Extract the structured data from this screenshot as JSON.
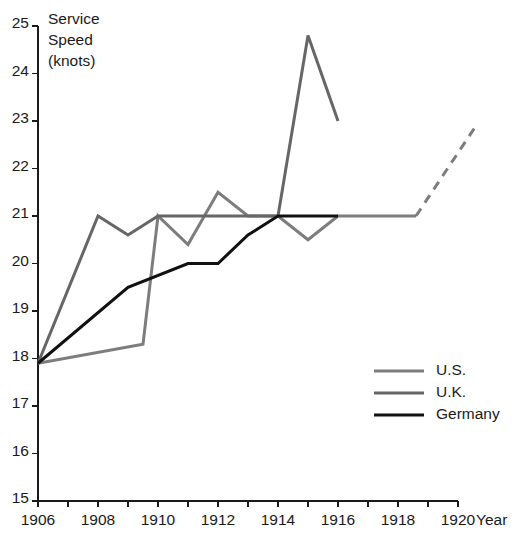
{
  "chart_data": {
    "type": "line",
    "title": "",
    "xlabel": "Year",
    "ylabel": "Service Speed (knots)",
    "ylabel_lines": [
      "Service",
      "Speed",
      "(knots)"
    ],
    "xlim": [
      1906,
      1920
    ],
    "ylim": [
      15,
      25
    ],
    "grid": false,
    "legend_position": "center-right",
    "x_ticks": [
      1906,
      1907,
      1908,
      1909,
      1910,
      1911,
      1912,
      1913,
      1914,
      1915,
      1916,
      1917,
      1918,
      1919,
      1920
    ],
    "x_tick_labels": [
      "1906",
      "",
      "1908",
      "",
      "1910",
      "",
      "1912",
      "",
      "1914",
      "",
      "1916",
      "",
      "1918",
      "",
      "1920"
    ],
    "y_ticks": [
      15,
      16,
      17,
      18,
      19,
      20,
      21,
      22,
      23,
      24,
      25
    ],
    "y_tick_labels": [
      "15",
      "16",
      "17",
      "18",
      "19",
      "20",
      "21",
      "22",
      "23",
      "24",
      "25"
    ],
    "series": [
      {
        "name": "U.S.",
        "color": "#7d7d7d",
        "width": 3.0,
        "x": [
          1906,
          1909.5,
          1910,
          1911,
          1912,
          1913,
          1914,
          1915,
          1916,
          1918.6
        ],
        "y": [
          17.9,
          18.3,
          21.0,
          20.4,
          21.5,
          21.0,
          21.0,
          20.5,
          21.0,
          21.0
        ],
        "dashed_tail": {
          "x": [
            1918.6,
            1920.6
          ],
          "y": [
            21.0,
            22.9
          ],
          "dash": "9 7"
        }
      },
      {
        "name": "U.K.",
        "color": "#666666",
        "width": 3.0,
        "x": [
          1906,
          1908,
          1909,
          1910,
          1911,
          1912,
          1913,
          1914,
          1915,
          1916
        ],
        "y": [
          17.9,
          21.0,
          20.6,
          21.0,
          21.0,
          21.0,
          21.0,
          21.0,
          24.8,
          23.0
        ]
      },
      {
        "name": "Germany",
        "color": "#111111",
        "width": 3.0,
        "x": [
          1906,
          1909,
          1911,
          1912,
          1913,
          1914,
          1916
        ],
        "y": [
          17.9,
          19.5,
          20.0,
          20.0,
          20.6,
          21.0,
          21.0
        ]
      }
    ],
    "legend": [
      {
        "label": "U.S.",
        "color": "#7d7d7d"
      },
      {
        "label": "U.K.",
        "color": "#666666"
      },
      {
        "label": "Germany",
        "color": "#111111"
      }
    ]
  }
}
